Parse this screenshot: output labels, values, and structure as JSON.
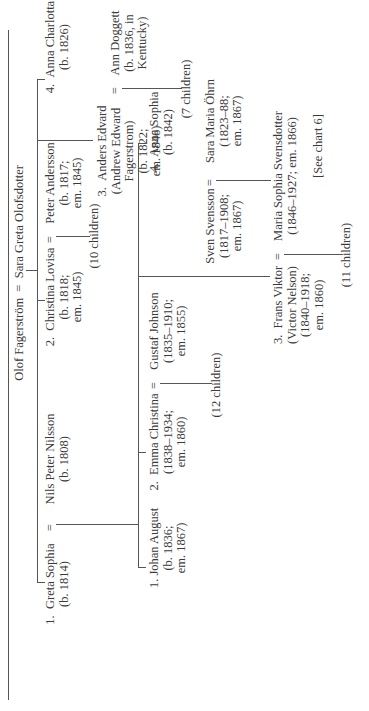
{
  "chart": {
    "orientation": "rotated-90-ccw",
    "root_couple": {
      "husband": "Olof Fagerström",
      "symbol": "=",
      "wife": "Sara Greta Olofsdotter"
    },
    "generation1": [
      {
        "num": "1.",
        "name": "Greta Sophia",
        "detail": [
          "(b. 1814)"
        ],
        "spouse": {
          "name": "Nils Peter Nilsson",
          "detail": [
            "(b. 1808)"
          ]
        }
      },
      {
        "num": "2.",
        "name": "Christina Lovisa",
        "detail": [
          "(b. 1818;",
          "em. 1845)"
        ],
        "spouse": {
          "name": "Peter Andersson",
          "detail": [
            "(b. 1817;",
            "em. 1845)"
          ]
        },
        "children_note": "(10 children)"
      },
      {
        "num": "3.",
        "name": "Anders Edvard",
        "detail": [
          "(Andrew Edward",
          "Fagerstrom)",
          "(b. 1822;",
          "em. 1846)"
        ],
        "spouse": {
          "name": "Ann Doggett",
          "detail": [
            "(b. 1836, in",
            "Kentucky)"
          ]
        },
        "children_note": "(7 children)"
      },
      {
        "num": "4.",
        "name": "Anna Charlotta",
        "detail": [
          "(b. 1826)"
        ]
      }
    ],
    "generation2": [
      {
        "num": "1.",
        "name": "Johan August",
        "detail": [
          "(b. 1836;",
          "em. 1867)"
        ]
      },
      {
        "num": "2.",
        "name": "Emma Christina",
        "detail": [
          "(1838–1934;",
          "em. 1860)"
        ],
        "spouse": {
          "name": "Gustaf Johnson",
          "detail": [
            "(1835–1910;",
            "em. 1855)"
          ]
        },
        "children_note": "(12 children)"
      },
      {
        "num": "3.",
        "name": "Frans Viktor",
        "detail": [
          "(Victor Nelson)",
          "(1840–1918;",
          "em. 1860)"
        ],
        "spouse": {
          "name": "Maria Sophia Svensdotter",
          "detail": [
            "(1846–1927; em. 1866)"
          ]
        },
        "children_note": "(11 children)"
      },
      {
        "num": "4.",
        "name": "Anna Sophia",
        "detail": [
          "(b. 1842)"
        ]
      }
    ],
    "in_law_couple": {
      "husband": {
        "name": "Sven Svensson",
        "detail": [
          "(1817–1908;",
          "em. 1867)"
        ]
      },
      "wife": {
        "name": "Sara Maria Öhrn",
        "detail": [
          "(1823–88;",
          "em. 1867)"
        ]
      }
    },
    "cross_reference": "[See chart 6]",
    "line_color": "#555555",
    "text_color": "#3a3a3a"
  }
}
